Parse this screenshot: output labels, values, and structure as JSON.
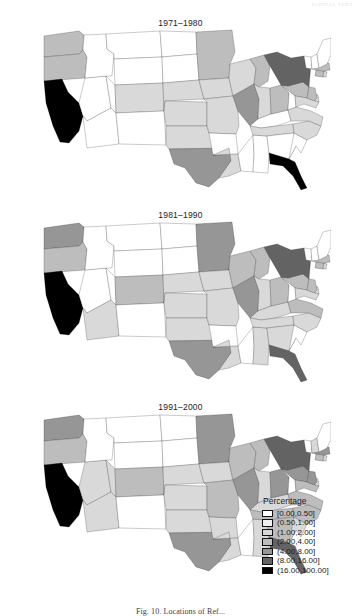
{
  "running_head": "PARTIAL TEXT",
  "figure": {
    "caption": "Fig. 10.  Locations of Ref...",
    "panels": [
      {
        "title": "1971–1980"
      },
      {
        "title": "1981–1990"
      },
      {
        "title": "1991–2000"
      }
    ]
  },
  "legend": {
    "title": "Percentage",
    "entries": [
      {
        "label": "[0.00,0.50]",
        "color": "#ffffff"
      },
      {
        "label": "(0.50,1.00]",
        "color": "#f0f0f0"
      },
      {
        "label": "(1.00,2.00]",
        "color": "#d9d9d9"
      },
      {
        "label": "(2.00,4.00]",
        "color": "#bdbdbd"
      },
      {
        "label": "(4.00,8.00]",
        "color": "#969696"
      },
      {
        "label": "(8.00,16.00]",
        "color": "#636363"
      },
      {
        "label": "(16.00,100.00]",
        "color": "#000000"
      }
    ]
  },
  "chart_data": {
    "type": "map",
    "subtitle": "",
    "xlabel": "",
    "ylabel": "",
    "legend_title": "Percentage",
    "legend_position": "bottom-right",
    "grid": false,
    "units": "percent",
    "bins": [
      {
        "index": 0,
        "range": "[0.00,0.50]",
        "min": 0.0,
        "max": 0.5,
        "color": "#ffffff"
      },
      {
        "index": 1,
        "range": "(0.50,1.00]",
        "min": 0.5,
        "max": 1.0,
        "color": "#f0f0f0"
      },
      {
        "index": 2,
        "range": "(1.00,2.00]",
        "min": 1.0,
        "max": 2.0,
        "color": "#d9d9d9"
      },
      {
        "index": 3,
        "range": "(2.00,4.00]",
        "min": 2.0,
        "max": 4.0,
        "color": "#bdbdbd"
      },
      {
        "index": 4,
        "range": "(4.00,8.00]",
        "min": 4.0,
        "max": 8.0,
        "color": "#969696"
      },
      {
        "index": 5,
        "range": "(8.00,16.00]",
        "min": 8.0,
        "max": 16.0,
        "color": "#636363"
      },
      {
        "index": 6,
        "range": "(16.00,100.00]",
        "min": 16.0,
        "max": 100.0,
        "color": "#000000"
      }
    ],
    "panels": [
      {
        "title": "1971–1980",
        "values": {
          "WA": 3,
          "OR": 3,
          "CA": 6,
          "NV": 0,
          "ID": 0,
          "MT": 0,
          "WY": 0,
          "UT": 0,
          "AZ": 0,
          "CO": 2,
          "NM": 0,
          "ND": 0,
          "SD": 0,
          "NE": 2,
          "KS": 2,
          "OK": 2,
          "TX": 4,
          "MN": 3,
          "IA": 2,
          "MO": 2,
          "AR": 0,
          "LA": 2,
          "WI": 2,
          "IL": 4,
          "MS": 0,
          "AL": 0,
          "MI": 3,
          "IN": 2,
          "KY": 0,
          "TN": 2,
          "OH": 3,
          "GA": 0,
          "FL": 6,
          "SC": 0,
          "NC": 2,
          "VA": 2,
          "WV": 0,
          "PA": 3,
          "NY": 5,
          "MD": 2,
          "DE": 2,
          "NJ": 3,
          "CT": 3,
          "RI": 2,
          "MA": 3,
          "VT": 0,
          "NH": 0,
          "ME": 0
        }
      },
      {
        "title": "1981–1990",
        "values": {
          "WA": 4,
          "OR": 3,
          "CA": 6,
          "NV": 0,
          "ID": 0,
          "MT": 0,
          "WY": 0,
          "UT": 0,
          "AZ": 2,
          "CO": 3,
          "NM": 0,
          "ND": 0,
          "SD": 0,
          "NE": 2,
          "KS": 2,
          "OK": 2,
          "TX": 4,
          "MN": 4,
          "IA": 2,
          "MO": 2,
          "AR": 0,
          "LA": 2,
          "WI": 3,
          "IL": 4,
          "MS": 0,
          "AL": 2,
          "MI": 3,
          "IN": 2,
          "KY": 2,
          "TN": 2,
          "OH": 3,
          "GA": 2,
          "FL": 5,
          "SC": 0,
          "NC": 2,
          "VA": 3,
          "WV": 0,
          "PA": 3,
          "NY": 5,
          "MD": 2,
          "DE": 2,
          "NJ": 3,
          "CT": 3,
          "RI": 2,
          "MA": 3,
          "VT": 0,
          "NH": 0,
          "ME": 0
        }
      },
      {
        "title": "1991–2000",
        "values": {
          "WA": 4,
          "OR": 3,
          "CA": 6,
          "NV": 2,
          "ID": 0,
          "MT": 0,
          "WY": 0,
          "UT": 2,
          "AZ": 2,
          "CO": 3,
          "NM": 0,
          "ND": 0,
          "SD": 0,
          "NE": 2,
          "KS": 2,
          "OK": 2,
          "TX": 4,
          "MN": 4,
          "IA": 2,
          "MO": 3,
          "AR": 2,
          "LA": 2,
          "WI": 3,
          "IL": 4,
          "MS": 0,
          "AL": 2,
          "MI": 3,
          "IN": 2,
          "KY": 2,
          "TN": 3,
          "OH": 4,
          "GA": 3,
          "FL": 5,
          "SC": 2,
          "NC": 3,
          "VA": 3,
          "WV": 0,
          "PA": 4,
          "NY": 5,
          "MD": 3,
          "DE": 2,
          "NJ": 4,
          "CT": 3,
          "RI": 2,
          "MA": 4,
          "VT": 0,
          "NH": 2,
          "ME": 0
        }
      }
    ]
  }
}
